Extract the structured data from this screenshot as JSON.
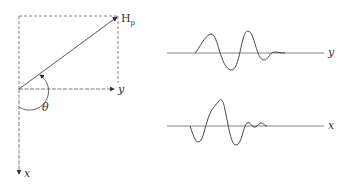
{
  "figure": {
    "vector_diagram": {
      "vector_label": "H",
      "vector_subscript": "p",
      "angle_label": "θ",
      "y_axis_label": "y",
      "x_axis_label": "x"
    },
    "waveforms": [
      {
        "name": "y-component",
        "axis_label": "y"
      },
      {
        "name": "x-component",
        "axis_label": "x"
      }
    ]
  },
  "colors": {
    "line": "#444444",
    "background": "#ffffff"
  }
}
